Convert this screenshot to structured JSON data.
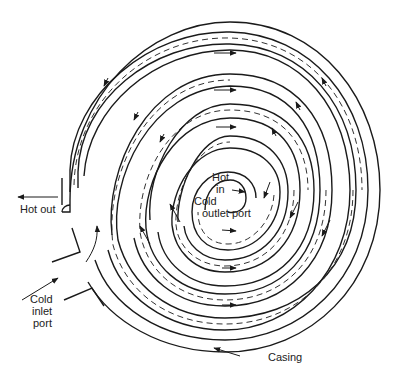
{
  "diagram": {
    "labels": {
      "hot_out": "Hot out",
      "hot_in_line1": "Hot",
      "hot_in_line2": "in",
      "cold_outlet_line1": "Cold",
      "cold_outlet_line2": "outlet port",
      "cold_inlet_line1": "Cold",
      "cold_inlet_line2": "inlet",
      "cold_inlet_line3": "port",
      "casing": "Casing"
    },
    "colors": {
      "line": "#1a1a1a",
      "background": "#ffffff"
    }
  }
}
